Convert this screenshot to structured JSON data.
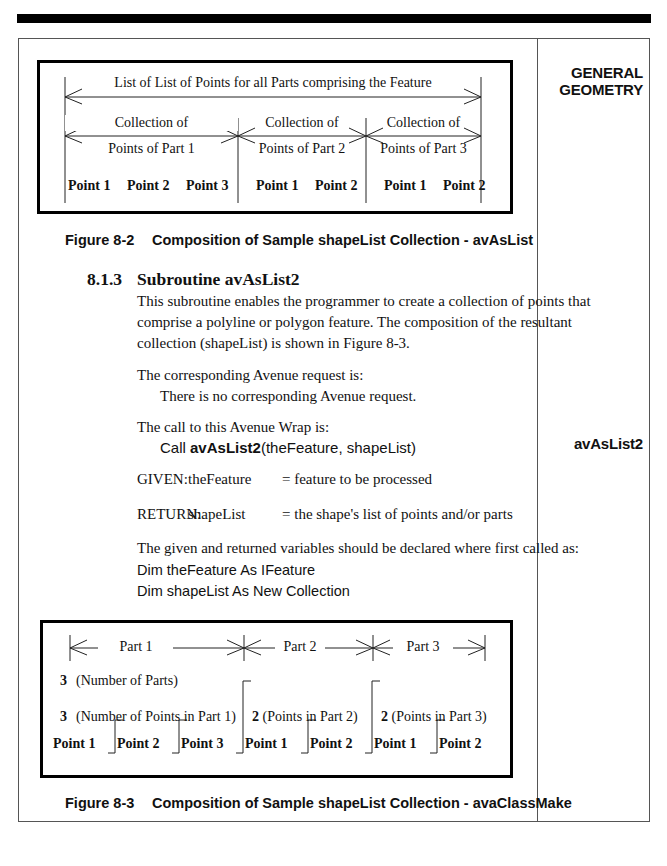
{
  "sidebar": {
    "section_title_line1": "GENERAL",
    "section_title_line2": "GEOMETRY",
    "marker": "avAsList2"
  },
  "figure_8_2": {
    "top_label": "List of List of Points for all Parts comprising the Feature",
    "parts": [
      {
        "line1": "Collection of",
        "line2": "Points of Part 1",
        "points": [
          "Point 1",
          "Point 2",
          "Point 3"
        ]
      },
      {
        "line1": "Collection of",
        "line2": "Points of Part 2",
        "points": [
          "Point 1",
          "Point 2"
        ]
      },
      {
        "line1": "Collection of",
        "line2": "Points of Part 3",
        "points": [
          "Point 1",
          "Point 2"
        ]
      }
    ],
    "caption_number": "Figure 8-2",
    "caption_text": "Composition of Sample shapeList Collection - avAsList"
  },
  "section": {
    "number": "8.1.3",
    "title": "Subroutine avAsList2",
    "paragraph_lines": [
      "This subroutine enables the programmer to create a collection of points that",
      "comprise a polyline or polygon feature.  The composition of the resultant",
      "collection (shapeList) is shown in Figure 8-3."
    ],
    "avenue_intro": "The corresponding Avenue request is:",
    "avenue_value": "There is no corresponding Avenue request.",
    "call_intro": "The call to this Avenue Wrap is:",
    "call_prefix": "Call ",
    "call_name": "avAsList2",
    "call_args": "(theFeature, shapeList)",
    "given_label": "GIVEN:",
    "given_var": "theFeature",
    "given_desc": "= feature to be processed",
    "return_label": "RETURN:",
    "return_var": "shapeList",
    "return_desc": "= the shape's list of points and/or parts",
    "declare_intro": "The given and returned variables should be declared where first called as:",
    "declare_lines": [
      "Dim theFeature As IFeature",
      "Dim shapeList As New Collection"
    ]
  },
  "figure_8_3": {
    "parts": [
      "Part 1",
      "Part 2",
      "Part 3"
    ],
    "num_parts_value": "3",
    "num_parts_label": "(Number of Parts)",
    "part_counts": [
      {
        "value": "3",
        "label": "(Number of Points in Part 1)"
      },
      {
        "value": "2",
        "label": "(Points in Part 2)"
      },
      {
        "value": "2",
        "label": "(Points in Part 3)"
      }
    ],
    "points": [
      "Point 1",
      "Point 2",
      "Point 3",
      "Point 1",
      "Point 2",
      "Point 1",
      "Point 2"
    ],
    "caption_number": "Figure 8-3",
    "caption_text": "Composition of Sample shapeList Collection - avaClassMake"
  }
}
